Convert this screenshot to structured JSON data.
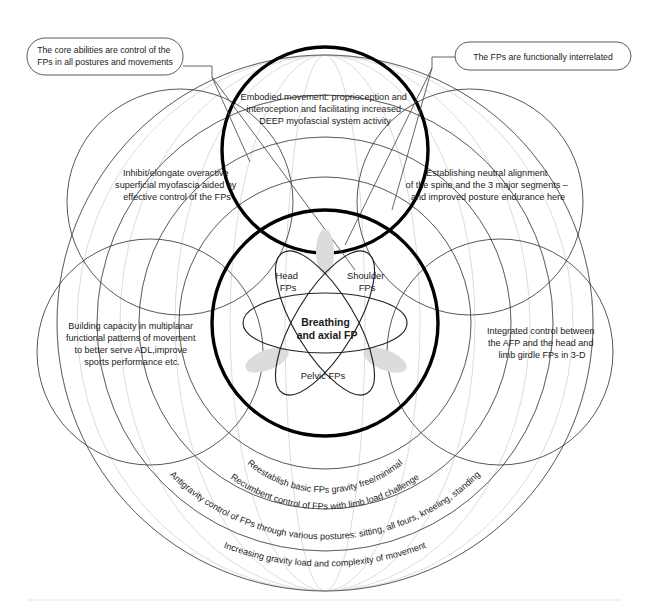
{
  "figure": {
    "background_color": "#ffffff",
    "bold_circle_color": "#000000",
    "faint_grid_color": "#d2d2d2",
    "lens_fill_color": "#dcdcdc"
  },
  "callouts": [
    {
      "id": "callout-core-abilities",
      "lines": [
        "The core abilities are control of the",
        "FPs in all postures and movements"
      ]
    },
    {
      "id": "callout-interrelated",
      "lines": [
        "The FPs are functionally interrelated"
      ]
    }
  ],
  "lobes": [
    {
      "id": "lobe-embodied-movement",
      "position": "top",
      "lines": [
        "Embodied movement: proprioception and",
        "interoception and facilitating increased",
        "DEEP myofascial system activity"
      ]
    },
    {
      "id": "lobe-inhibit-elongate",
      "position": "upper-left",
      "lines": [
        "Inhibit/elongate overactive",
        "superficial myofascia aided by",
        "effective control of the FPs"
      ]
    },
    {
      "id": "lobe-neutral-alignment",
      "position": "upper-right",
      "lines": [
        "Establishing neutral alignment",
        "of the spine and the 3 major segments –",
        "and improved posture endurance here"
      ]
    },
    {
      "id": "lobe-building-capacity",
      "position": "lower-left",
      "lines": [
        "Building capacity in multiplanar",
        "functional patterns of movement",
        "to better serve ADL,improve",
        "sports performance etc."
      ]
    },
    {
      "id": "lobe-integrated-control",
      "position": "lower-right",
      "lines": [
        "Integrated control between",
        "the AFP and the head and",
        "limb girdle FPs in 3-D"
      ]
    }
  ],
  "core": {
    "center_label_lines": [
      "Breathing",
      "and axial FP"
    ],
    "petals": [
      {
        "id": "petal-head",
        "lines": [
          "Head",
          "FPs"
        ]
      },
      {
        "id": "petal-shoulder",
        "lines": [
          "Shoulder",
          "FPs"
        ]
      },
      {
        "id": "petal-pelvic",
        "lines": [
          "Pelvic FPs"
        ]
      }
    ]
  },
  "arcs": [
    {
      "id": "arc-reestablish",
      "text": "Reestablish basic FPs gravity free/minimal"
    },
    {
      "id": "arc-recumbent",
      "text": "Recumbent control of FPs with limb load challenge"
    },
    {
      "id": "arc-antigravity",
      "text": "Antigravity control of FPs through various postures: sitting, all fours, kneeling, standing"
    },
    {
      "id": "arc-increasing-gravity",
      "text": "Increasing gravity load and complexity of movement"
    }
  ]
}
